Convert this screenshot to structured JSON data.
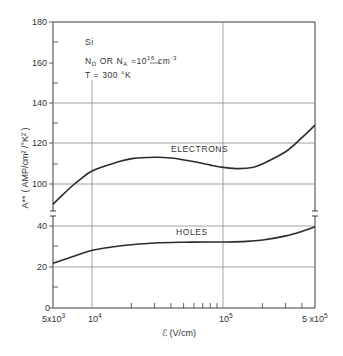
{
  "chart_data": {
    "type": "line",
    "title": "",
    "xlabel": "ℰ (V/cm)",
    "ylabel": "A** (AMP/cm²/°K²)",
    "xscale": "log",
    "xlim": [
      5000,
      500000
    ],
    "ylim": [
      0,
      180
    ],
    "y_axis_break": [
      40,
      90
    ],
    "grid": true,
    "x_tick_labels": [
      "5x10³",
      "10⁴",
      "10⁵",
      "5x10⁵"
    ],
    "x_ticks": [
      5000,
      10000,
      100000,
      500000
    ],
    "y_tick_labels": [
      "0",
      "20",
      "40",
      "100",
      "120",
      "140",
      "160",
      "180"
    ],
    "y_ticks": [
      0,
      20,
      40,
      100,
      120,
      140,
      160,
      180
    ],
    "annotations": [
      {
        "text": "Si",
        "position": "upper-left"
      },
      {
        "text": "N_D OR N_A = 10^16 cm^-3",
        "position": "upper-left"
      },
      {
        "text": "T = 300 °K",
        "position": "upper-left"
      }
    ],
    "series": [
      {
        "name": "ELECTRONS",
        "x": [
          5000,
          6000,
          7000,
          8000,
          10000,
          15000,
          20000,
          30000,
          40000,
          60000,
          80000,
          100000,
          130000,
          170000,
          200000,
          300000,
          400000,
          500000
        ],
        "values": [
          90,
          95,
          99,
          102,
          106.5,
          110.5,
          112.5,
          113.2,
          112.8,
          111,
          109.3,
          108.2,
          107.6,
          108.3,
          110,
          116,
          123,
          129
        ]
      },
      {
        "name": "HOLES",
        "x": [
          5000,
          6000,
          7000,
          8000,
          10000,
          15000,
          20000,
          30000,
          50000,
          80000,
          100000,
          150000,
          200000,
          300000,
          400000,
          500000
        ],
        "values": [
          22,
          23.8,
          25.2,
          26.5,
          28.4,
          30.3,
          31.2,
          32,
          32.4,
          32.5,
          32.5,
          32.8,
          33.5,
          35.5,
          37.8,
          40
        ]
      }
    ]
  },
  "labels": {
    "material": "Si",
    "doping_prefix": "N",
    "doping_d": "D",
    "doping_or": " OR N",
    "doping_a": "A",
    "doping_eq": " =10",
    "doping_exp": "16",
    "doping_unit": " cm",
    "doping_unit_exp": "-3",
    "temperature": "T = 300 °K",
    "electrons": "ELECTRONS",
    "holes": "HOLES",
    "xlabel": "ℰ (V/cm)",
    "ylabel_main": "A**",
    "ylabel_units": "( AMP/cm² /°K² )",
    "x_tick_0": "5x10",
    "x_tick_0_exp": "3",
    "x_tick_1": "10",
    "x_tick_1_exp": "4",
    "x_tick_2": "10",
    "x_tick_2_exp": "5",
    "x_tick_3": "5 x10",
    "x_tick_3_exp": "5",
    "y_0": "0",
    "y_20": "20",
    "y_40": "40",
    "y_100": "100",
    "y_120": "120",
    "y_140": "140",
    "y_160": "160",
    "y_180": "180"
  },
  "colors": {
    "line": "#2b2b2b",
    "grid": "#8a8a8a",
    "axis": "#3a3a3a"
  }
}
